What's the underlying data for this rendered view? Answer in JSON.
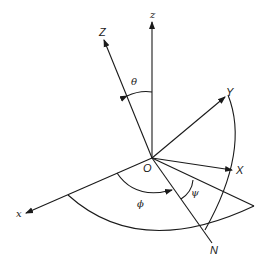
{
  "diagram": {
    "labels": {
      "origin": "O",
      "fixed_z": "z",
      "fixed_x": "x",
      "body_Z": "Z",
      "body_Y": "Y",
      "body_X": "X",
      "node_line": "N",
      "theta": "θ",
      "phi": "ϕ",
      "psi": "ψ"
    },
    "colors": {
      "ink": "#1a1a1a",
      "background": "#ffffff"
    }
  }
}
